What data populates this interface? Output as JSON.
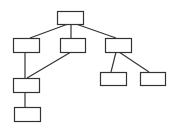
{
  "diagram": {
    "type": "tree",
    "stroke_color": "#333333",
    "fill_color": "#ffffff",
    "nodes": [
      {
        "id": "root",
        "x": 57,
        "y": 11,
        "w": 26,
        "h": 13,
        "label": ""
      },
      {
        "id": "a",
        "x": 13,
        "y": 38,
        "w": 26,
        "h": 14,
        "label": ""
      },
      {
        "id": "b",
        "x": 60,
        "y": 38,
        "w": 25,
        "h": 14,
        "label": ""
      },
      {
        "id": "c",
        "x": 105,
        "y": 38,
        "w": 26,
        "h": 14,
        "label": ""
      },
      {
        "id": "d",
        "x": 13,
        "y": 78,
        "w": 26,
        "h": 14,
        "label": ""
      },
      {
        "id": "e",
        "x": 14,
        "y": 107,
        "w": 26,
        "h": 14,
        "label": ""
      },
      {
        "id": "f",
        "x": 100,
        "y": 72,
        "w": 26,
        "h": 13,
        "label": ""
      },
      {
        "id": "g",
        "x": 140,
        "y": 72,
        "w": 25,
        "h": 13,
        "label": ""
      }
    ],
    "edges": [
      {
        "from": "root",
        "to": "a",
        "x1": 68,
        "y1": 24,
        "x2": 30,
        "y2": 38
      },
      {
        "from": "root",
        "to": "b",
        "x1": 71,
        "y1": 24,
        "x2": 71,
        "y2": 38
      },
      {
        "from": "root",
        "to": "c",
        "x1": 76,
        "y1": 24,
        "x2": 116,
        "y2": 38
      },
      {
        "from": "a",
        "to": "d",
        "x1": 25,
        "y1": 52,
        "x2": 25,
        "y2": 78
      },
      {
        "from": "b",
        "to": "d",
        "x1": 71,
        "y1": 52,
        "x2": 27,
        "y2": 78
      },
      {
        "from": "d",
        "to": "e",
        "x1": 25,
        "y1": 92,
        "x2": 25,
        "y2": 107
      },
      {
        "from": "c",
        "to": "f",
        "x1": 116,
        "y1": 52,
        "x2": 111,
        "y2": 72
      },
      {
        "from": "c",
        "to": "g",
        "x1": 119,
        "y1": 52,
        "x2": 149,
        "y2": 72
      }
    ]
  }
}
